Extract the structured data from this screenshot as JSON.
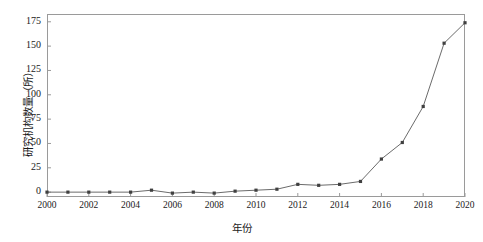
{
  "chart_data": {
    "type": "line",
    "title": "",
    "xlabel": "年份",
    "ylabel": "研究机构数量（所）",
    "x": [
      2000,
      2001,
      2002,
      2003,
      2004,
      2005,
      2006,
      2007,
      2008,
      2009,
      2010,
      2011,
      2012,
      2013,
      2014,
      2015,
      2016,
      2017,
      2018,
      2019,
      2020
    ],
    "values": [
      0,
      0,
      0,
      0,
      0,
      2,
      -1,
      0,
      -1,
      1,
      2,
      3,
      8,
      7,
      8,
      11,
      34,
      51,
      88,
      153,
      174
    ],
    "series": [
      {
        "name": "研究机构数量",
        "values": [
          0,
          0,
          0,
          0,
          0,
          2,
          -1,
          0,
          -1,
          1,
          2,
          3,
          8,
          7,
          8,
          11,
          34,
          51,
          88,
          153,
          174
        ]
      }
    ],
    "xlim": [
      2000,
      2020
    ],
    "ylim": [
      -5,
      183
    ],
    "xticks": [
      2000,
      2002,
      2004,
      2006,
      2008,
      2010,
      2012,
      2014,
      2016,
      2018,
      2020
    ],
    "xtick_labels": [
      "2000",
      "2002",
      "2004",
      "2006",
      "2008",
      "2010",
      "2012",
      "2014",
      "2016",
      "2018",
      "2020"
    ],
    "yticks": [
      0,
      25,
      50,
      75,
      100,
      125,
      150,
      175
    ],
    "ytick_labels": [
      "0",
      "25",
      "50",
      "75",
      "100",
      "125",
      "150",
      "175"
    ],
    "grid": false,
    "legend": false,
    "legend_position": "none",
    "marker": "square",
    "line_color": "#6b6b6b",
    "marker_color": "#404040",
    "frame_color": "#9a9a9a",
    "background_color": "#ffffff"
  }
}
